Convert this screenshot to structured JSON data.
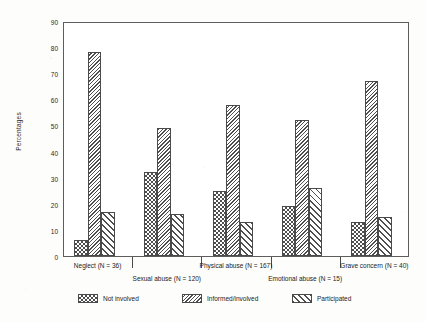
{
  "chart_data": {
    "type": "bar",
    "title": "",
    "xlabel": "",
    "ylabel": "Percentages",
    "ylim": [
      0,
      90
    ],
    "yticks": [
      0,
      10,
      20,
      30,
      40,
      50,
      60,
      70,
      80,
      90
    ],
    "grid": false,
    "legend_position": "bottom",
    "categories": [
      "Neglect (N = 36)",
      "Sexual abuse (N = 120)",
      "Physical abuse (N = 167)",
      "Emotional abuse (N = 15)",
      "Grave concern (N = 40)"
    ],
    "series": [
      {
        "name": "Not involved",
        "pattern": "checker",
        "values": [
          6,
          32,
          25,
          19,
          13
        ]
      },
      {
        "name": "Informed/involved",
        "pattern": "fine",
        "values": [
          78,
          49,
          58,
          52,
          67
        ]
      },
      {
        "name": "Participated",
        "pattern": "wide",
        "values": [
          17,
          16,
          13,
          26,
          15
        ]
      }
    ]
  },
  "legend": {
    "items": [
      {
        "label": "Not involved",
        "pattern": "checker"
      },
      {
        "label": "Informed/involved",
        "pattern": "fine"
      },
      {
        "label": "Participated",
        "pattern": "wide"
      }
    ]
  },
  "axis": {
    "y_title": "Percentages"
  },
  "colors": {
    "ink": "#4a4a4a",
    "text": "#222222",
    "paper": "#fdfdfc"
  }
}
